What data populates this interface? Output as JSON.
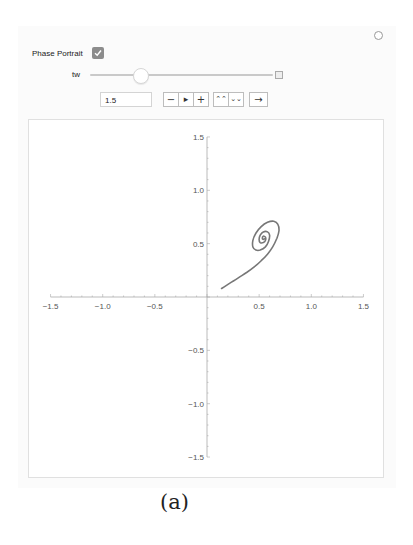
{
  "controls": {
    "phase_portrait_label": "Phase Portrait",
    "phase_portrait_checked": true,
    "slider_label": "tw",
    "slider_value": "1.5",
    "slider_position_fraction": 0.27,
    "buttons": {
      "decrement": "−",
      "play": "▸",
      "increment": "+",
      "faster": "⌃⌃",
      "slower": "⌄⌄",
      "direction": "→"
    },
    "icons": {
      "options": "gear-icon",
      "slider_expand": "plus-square-icon",
      "checkbox": "check-icon"
    }
  },
  "caption": "(a)",
  "chart_data": {
    "type": "line",
    "title": "",
    "xlabel": "",
    "ylabel": "",
    "xlim": [
      -1.5,
      1.5
    ],
    "ylim": [
      -1.5,
      1.5
    ],
    "grid": false,
    "legend": null,
    "x_ticks": [
      "-1.5",
      "-1.0",
      "-0.5",
      "0.5",
      "1.0",
      "1.5"
    ],
    "y_ticks": [
      "1.5",
      "1.0",
      "0.5",
      "-0.5",
      "-1.0",
      "-1.5"
    ],
    "x_tick_values": [
      -1.5,
      -1.0,
      -0.5,
      0.5,
      1.0,
      1.5
    ],
    "y_tick_values": [
      1.5,
      1.0,
      0.5,
      -0.5,
      -1.0,
      -1.5
    ],
    "series": [
      {
        "name": "trajectory",
        "color": "#777777",
        "points": [
          [
            0.14,
            0.08
          ],
          [
            0.22,
            0.13
          ],
          [
            0.3,
            0.18
          ],
          [
            0.38,
            0.23
          ],
          [
            0.45,
            0.28
          ],
          [
            0.52,
            0.34
          ],
          [
            0.58,
            0.4
          ],
          [
            0.63,
            0.47
          ],
          [
            0.67,
            0.55
          ],
          [
            0.69,
            0.62
          ],
          [
            0.68,
            0.68
          ],
          [
            0.64,
            0.71
          ],
          [
            0.58,
            0.7
          ],
          [
            0.52,
            0.66
          ],
          [
            0.47,
            0.6
          ],
          [
            0.44,
            0.53
          ],
          [
            0.44,
            0.47
          ],
          [
            0.47,
            0.44
          ],
          [
            0.51,
            0.44
          ],
          [
            0.56,
            0.47
          ],
          [
            0.59,
            0.52
          ],
          [
            0.6,
            0.58
          ],
          [
            0.58,
            0.61
          ],
          [
            0.54,
            0.61
          ],
          [
            0.51,
            0.58
          ],
          [
            0.5,
            0.54
          ],
          [
            0.51,
            0.51
          ],
          [
            0.54,
            0.51
          ],
          [
            0.56,
            0.53
          ],
          [
            0.56,
            0.56
          ],
          [
            0.54,
            0.57
          ],
          [
            0.53,
            0.55
          ],
          [
            0.54,
            0.54
          ],
          [
            0.55,
            0.545
          ]
        ]
      }
    ]
  }
}
